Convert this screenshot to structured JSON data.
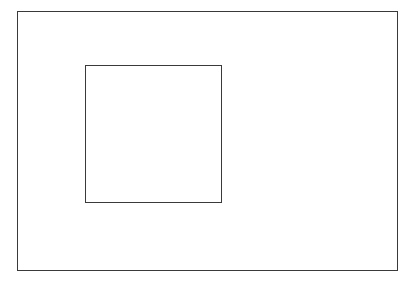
{
  "diagram": {
    "type": "nested-rectangles",
    "background": "#ffffff",
    "stroke_color": "#3a3a3a",
    "stroke_width": 1.5,
    "shapes": [
      {
        "id": "outer-frame",
        "kind": "rectangle",
        "x": 17,
        "y": 11,
        "width": 381,
        "height": 260
      },
      {
        "id": "inner-box",
        "kind": "rectangle",
        "x": 85,
        "y": 65,
        "width": 137,
        "height": 138
      }
    ],
    "labels": []
  }
}
